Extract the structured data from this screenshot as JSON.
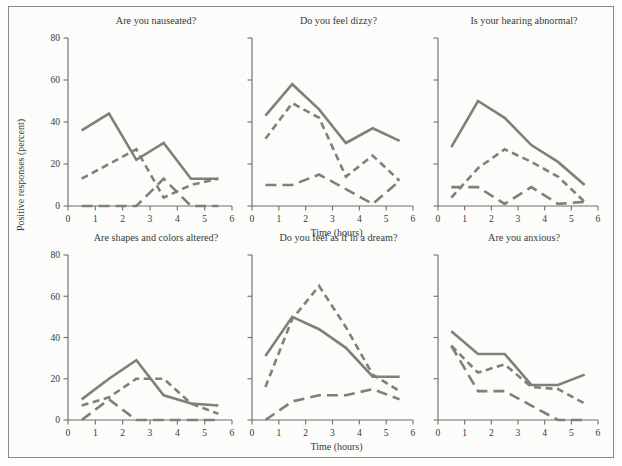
{
  "figure": {
    "background_color": "#fcfcfa",
    "frame_color": "#8a8a86",
    "line_color": "#808078",
    "axis_color": "#6f6f6c"
  },
  "axes": {
    "xlabel": "Time (hours)",
    "ylabel": "Positive responses (percent)",
    "xticks": [
      "0",
      "1",
      "2",
      "3",
      "4",
      "5",
      "6"
    ],
    "yticks": [
      "0",
      "20",
      "40",
      "60",
      "80"
    ],
    "xlim": [
      0,
      6
    ],
    "ylim": [
      0,
      80
    ]
  },
  "chart_data": {
    "type": "line",
    "title": "",
    "xlabel": "Time (hours)",
    "ylabel": "Positive responses (percent)",
    "xlim": [
      0,
      6
    ],
    "ylim": [
      0,
      80
    ],
    "grid": false,
    "legend_position": "none",
    "x": [
      0.5,
      1.5,
      2.5,
      3.5,
      4.5,
      5.5
    ],
    "line_styles": {
      "high_dose": "solid",
      "medium_dose": "short-dash",
      "placebo": "long-dash"
    },
    "panels": [
      {
        "title": "Are you nauseated?",
        "row": 0,
        "col": 0,
        "series": [
          {
            "name": "high_dose",
            "style": "solid",
            "values": [
              36,
              44,
              22,
              30,
              13,
              13
            ]
          },
          {
            "name": "medium_dose",
            "style": "short-dash",
            "values": [
              13,
              20,
              27,
              4,
              10,
              13
            ]
          },
          {
            "name": "placebo",
            "style": "long-dash",
            "values": [
              0,
              0,
              0,
              13,
              0,
              0
            ]
          }
        ]
      },
      {
        "title": "Do you feel dizzy?",
        "row": 0,
        "col": 1,
        "series": [
          {
            "name": "high_dose",
            "style": "solid",
            "values": [
              43,
              58,
              46,
              30,
              37,
              31
            ]
          },
          {
            "name": "medium_dose",
            "style": "short-dash",
            "values": [
              32,
              49,
              42,
              14,
              24,
              12
            ]
          },
          {
            "name": "placebo",
            "style": "long-dash",
            "values": [
              10,
              10,
              15,
              8,
              1,
              12
            ]
          }
        ]
      },
      {
        "title": "Is your hearing abnormal?",
        "row": 0,
        "col": 2,
        "series": [
          {
            "name": "high_dose",
            "style": "solid",
            "values": [
              28,
              50,
              42,
              29,
              21,
              10
            ]
          },
          {
            "name": "medium_dose",
            "style": "short-dash",
            "values": [
              4,
              18,
              27,
              21,
              14,
              2
            ]
          },
          {
            "name": "placebo",
            "style": "long-dash",
            "values": [
              9,
              9,
              1,
              9,
              1,
              2
            ]
          }
        ]
      },
      {
        "title": "Are shapes and colors altered?",
        "row": 1,
        "col": 0,
        "series": [
          {
            "name": "high_dose",
            "style": "solid",
            "values": [
              10,
              20,
              29,
              12,
              8,
              7
            ]
          },
          {
            "name": "medium_dose",
            "style": "short-dash",
            "values": [
              7,
              11,
              20,
              20,
              8,
              3
            ]
          },
          {
            "name": "placebo",
            "style": "long-dash",
            "values": [
              0,
              10,
              0,
              0,
              0,
              0
            ]
          }
        ]
      },
      {
        "title": "Do you feel as if in a dream?",
        "row": 1,
        "col": 1,
        "series": [
          {
            "name": "high_dose",
            "style": "solid",
            "values": [
              31,
              50,
              44,
              35,
              21,
              21
            ]
          },
          {
            "name": "medium_dose",
            "style": "short-dash",
            "values": [
              16,
              49,
              65,
              45,
              22,
              14
            ]
          },
          {
            "name": "placebo",
            "style": "long-dash",
            "values": [
              0,
              9,
              12,
              12,
              15,
              10
            ]
          }
        ]
      },
      {
        "title": "Are you anxious?",
        "row": 1,
        "col": 2,
        "series": [
          {
            "name": "high_dose",
            "style": "solid",
            "values": [
              43,
              32,
              32,
              17,
              17,
              22
            ]
          },
          {
            "name": "medium_dose",
            "style": "short-dash",
            "values": [
              36,
              23,
              27,
              16,
              15,
              8
            ]
          },
          {
            "name": "placebo",
            "style": "long-dash",
            "values": [
              36,
              14,
              14,
              7,
              0,
              0
            ]
          }
        ]
      }
    ]
  }
}
